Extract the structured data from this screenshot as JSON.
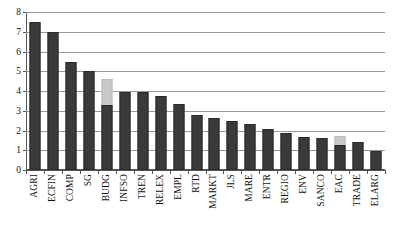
{
  "chart_data": {
    "type": "bar",
    "title": "",
    "subtitle": "",
    "xlabel": "",
    "ylabel": "",
    "ylim": [
      0,
      8
    ],
    "yticks": [
      0,
      1,
      2,
      3,
      4,
      5,
      6,
      7,
      8
    ],
    "ytick_labels": [
      "0",
      "1",
      "2",
      "3",
      "4",
      "5",
      "6",
      "7",
      "8"
    ],
    "grid": "horizontal",
    "legend": "none",
    "stacked": true,
    "categories": [
      "AGRI",
      "ECFIN",
      "COMP",
      "SG",
      "BUDG",
      "INFSO",
      "TREN",
      "RELEX",
      "EMPL",
      "RTD",
      "MARKT",
      "JLS",
      "MARE",
      "ENTR",
      "REGIO",
      "ENV",
      "SANCO",
      "EAC",
      "TRADE",
      "ELARG"
    ],
    "series": [
      {
        "name": "primary",
        "color": "#3a3a3a",
        "values": [
          7.5,
          7.0,
          5.45,
          5.0,
          3.3,
          3.95,
          3.95,
          3.77,
          3.33,
          2.77,
          2.63,
          2.47,
          2.33,
          2.08,
          1.87,
          1.68,
          1.6,
          1.27,
          1.42,
          0.97
        ]
      },
      {
        "name": "secondary",
        "color": "#c9c9c9",
        "values": [
          0,
          0,
          0,
          0,
          1.3,
          0,
          0,
          0,
          0,
          0,
          0,
          0,
          0,
          0,
          0,
          0,
          0,
          0.45,
          0,
          0
        ]
      }
    ],
    "totals": [
      7.5,
      7.0,
      5.45,
      5.0,
      4.6,
      3.95,
      3.95,
      3.77,
      3.33,
      2.77,
      2.63,
      2.47,
      2.33,
      2.08,
      1.87,
      1.68,
      1.6,
      1.72,
      1.42,
      0.97
    ]
  },
  "colors": {
    "bar_primary": "#3a3a3a",
    "bar_secondary": "#c9c9c9",
    "gridline": "#9a9a9a",
    "axis": "#555555",
    "background": "#ffffff",
    "text": "#111111"
  }
}
